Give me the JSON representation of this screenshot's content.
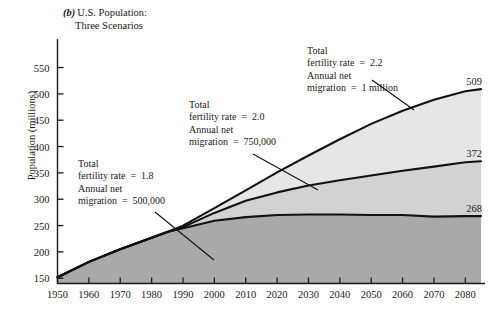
{
  "figure": {
    "panel_letter": "(b)",
    "title_line1": "U.S. Population:",
    "title_line2": "Three Scenarios",
    "ylabel": "Population (millions)"
  },
  "annotations": [
    {
      "id": "low",
      "line1": "Total",
      "line2": "fertility rate  =  1.8",
      "line3": "Annual net",
      "line4": "migration  =  500,000"
    },
    {
      "id": "middle",
      "line1": "Total",
      "line2": "fertility rate  =  2.0",
      "line3": "Annual net",
      "line4": "migration  =  750,000"
    },
    {
      "id": "high",
      "line1": "Total",
      "line2": "fertility rate  =  2.2",
      "line3": "Annual net",
      "line4": "migration  =  1 million"
    }
  ],
  "end_labels": {
    "high": "509",
    "middle": "372",
    "low": "268"
  },
  "colors": {
    "band_high": "#e6e6e6",
    "band_middle": "#d2d2d2",
    "band_low": "#a9a9a9",
    "line": "#111111",
    "axis": "#1a1a1a",
    "text": "#1a1a1a"
  },
  "chart_data": {
    "type": "area",
    "xlabel": "",
    "ylabel": "Population (millions)",
    "xlim": [
      1950,
      2085
    ],
    "ylim": [
      140,
      570
    ],
    "grid": false,
    "legend": "annotations with leader lines",
    "xticks": [
      1950,
      1960,
      1970,
      1980,
      1990,
      2000,
      2010,
      2020,
      2030,
      2040,
      2050,
      2060,
      2070,
      2080
    ],
    "yticks": [
      150,
      200,
      250,
      300,
      350,
      400,
      450,
      500,
      550
    ],
    "x": [
      1950,
      1960,
      1970,
      1980,
      1985,
      1990,
      2000,
      2010,
      2020,
      2030,
      2040,
      2050,
      2060,
      2070,
      2080,
      2085
    ],
    "series": [
      {
        "name": "Total fertility rate = 2.2, Annual net migration = 1 million",
        "end_value": 509,
        "values": [
          152,
          181,
          205,
          227,
          238,
          250,
          283,
          317,
          351,
          383,
          414,
          443,
          468,
          489,
          505,
          509
        ]
      },
      {
        "name": "Total fertility rate = 2.0, Annual net migration = 750,000",
        "end_value": 372,
        "values": [
          152,
          181,
          205,
          227,
          238,
          247,
          274,
          297,
          313,
          326,
          336,
          345,
          354,
          362,
          370,
          372
        ]
      },
      {
        "name": "Total fertility rate = 1.8, Annual net migration = 500,000",
        "end_value": 268,
        "values": [
          152,
          181,
          205,
          227,
          238,
          245,
          259,
          266,
          270,
          271,
          271,
          270,
          270,
          267,
          268,
          268
        ]
      }
    ],
    "historical_note": "Series coincide through roughly 1985; they diverge thereafter into three projection scenarios."
  }
}
